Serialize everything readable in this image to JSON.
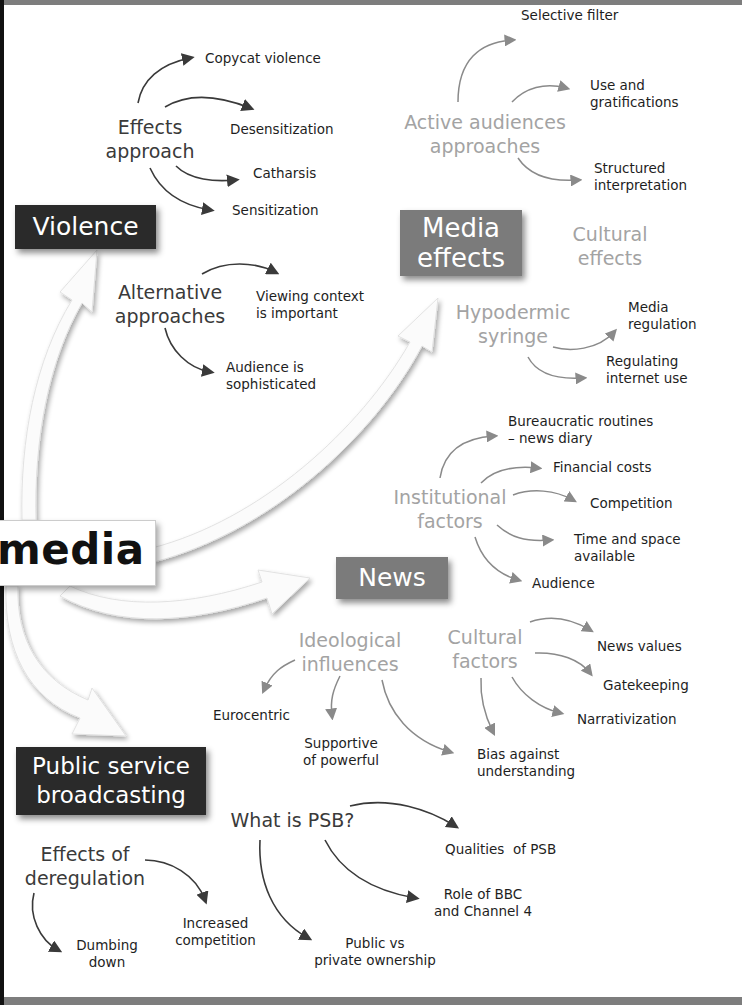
{
  "central": {
    "label": "media"
  },
  "topics": {
    "violence": {
      "label": "Violence",
      "effects_approach": {
        "label_line1": "Effects",
        "label_line2": "approach",
        "items": [
          "Copycat violence",
          "Desensitization",
          "Catharsis",
          "Sensitization"
        ]
      },
      "alternative_approaches": {
        "label_line1": "Alternative",
        "label_line2": "approaches",
        "items": [
          {
            "line1": "Viewing context",
            "line2": "is important"
          },
          {
            "line1": "Audience is",
            "line2": "sophisticated"
          }
        ]
      }
    },
    "media_effects": {
      "label_line1": "Media",
      "label_line2": "effects",
      "active_audiences": {
        "label_line1": "Active audiences",
        "label_line2": "approaches",
        "items": [
          {
            "line1": "Selective filter",
            "line2": ""
          },
          {
            "line1": "Use and",
            "line2": "gratifications"
          },
          {
            "line1": "Structured",
            "line2": "interpretation"
          }
        ]
      },
      "cultural_effects": {
        "label_line1": "Cultural",
        "label_line2": "effects"
      },
      "hypodermic_syringe": {
        "label_line1": "Hypodermic",
        "label_line2": "syringe",
        "items": [
          {
            "line1": "Media",
            "line2": "regulation"
          },
          {
            "line1": "Regulating",
            "line2": "internet use"
          }
        ]
      }
    },
    "news": {
      "label": "News",
      "institutional_factors": {
        "label_line1": "Institutional",
        "label_line2": "factors",
        "items": [
          {
            "line1": "Bureaucratic routines",
            "line2": "– news diary"
          },
          {
            "line1": "Financial costs",
            "line2": ""
          },
          {
            "line1": "Competition",
            "line2": ""
          },
          {
            "line1": "Time and space",
            "line2": "available"
          },
          {
            "line1": "Audience",
            "line2": ""
          }
        ]
      },
      "ideological_influences": {
        "label_line1": "Ideological",
        "label_line2": "influences",
        "items": [
          {
            "line1": "Eurocentric",
            "line2": ""
          },
          {
            "line1": "Supportive",
            "line2": "of powerful"
          },
          {
            "line1": "Bias against",
            "line2": "understanding"
          }
        ]
      },
      "cultural_factors": {
        "label_line1": "Cultural",
        "label_line2": "factors",
        "items": [
          "News values",
          "Gatekeeping",
          "Narrativization"
        ]
      }
    },
    "psb": {
      "label_line1": "Public service",
      "label_line2": "broadcasting",
      "what_is_psb": {
        "label": "What is PSB?",
        "items": [
          {
            "line1": "Qualities  of PSB",
            "line2": ""
          },
          {
            "line1": "Role of BBC",
            "line2": "and Channel 4"
          },
          {
            "line1": "Public vs",
            "line2": "private ownership"
          }
        ]
      },
      "effects_of_deregulation": {
        "label_line1": "Effects of",
        "label_line2": "deregulation",
        "items": [
          {
            "line1": "Increased",
            "line2": "competition"
          },
          {
            "line1": "Dumbing",
            "line2": "down"
          }
        ]
      }
    }
  },
  "colors": {
    "dark_box": "#2a2a2a",
    "grey_box": "#7b7b7b",
    "dark_text": "#3a3a3a",
    "light_text": "#a3a3a3",
    "frame": "#7d7d7d"
  }
}
